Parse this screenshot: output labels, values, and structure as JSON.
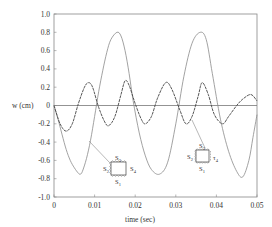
{
  "chart_data": {
    "type": "line",
    "title": "",
    "xlabel": "time (sec)",
    "ylabel": "w (cm)",
    "xlim": [
      0,
      0.05
    ],
    "ylim": [
      -1.0,
      1.0
    ],
    "x_ticks": [
      "0",
      "0.01",
      "0.02",
      "0.03",
      "0.04",
      "0.05"
    ],
    "y_ticks": [
      "1.0",
      "0.8",
      "0.6",
      "0.4",
      "0.2",
      "0",
      "-0.2",
      "-0.4",
      "-0.6",
      "-0.8",
      "-1.0"
    ],
    "grid": false,
    "zero_line": true,
    "series": [
      {
        "name": "S1, S2, S3 clamped; S4 simply supported",
        "style": "dark dashed",
        "color": "#444444",
        "x": [
          0,
          0.0015,
          0.003,
          0.0045,
          0.006,
          0.0075,
          0.0085,
          0.0095,
          0.011,
          0.0125,
          0.0135,
          0.015,
          0.0165,
          0.0175,
          0.0185,
          0.02,
          0.0215,
          0.0225,
          0.024,
          0.0255,
          0.0275,
          0.029,
          0.031,
          0.0325,
          0.034,
          0.0355,
          0.0365,
          0.038,
          0.0395,
          0.0415,
          0.043,
          0.045,
          0.0465,
          0.0485,
          0.05
        ],
        "y": [
          0,
          -0.2,
          -0.28,
          -0.2,
          0.02,
          0.2,
          0.25,
          0.2,
          -0.02,
          -0.18,
          -0.22,
          -0.12,
          0.12,
          0.27,
          0.22,
          0.02,
          -0.15,
          -0.2,
          -0.12,
          0.08,
          0.25,
          0.18,
          -0.05,
          -0.2,
          -0.12,
          0.1,
          0.25,
          0.12,
          -0.1,
          -0.2,
          -0.12,
          0.0,
          0.07,
          0.12,
          0.05
        ]
      },
      {
        "name": "S1, S3 clamped; S2 simply supported; S4 free",
        "style": "gray solid",
        "color": "#8a8a8a",
        "x": [
          0,
          0.001,
          0.002,
          0.003,
          0.004,
          0.005,
          0.006,
          0.0065,
          0.007,
          0.008,
          0.009,
          0.01,
          0.011,
          0.012,
          0.013,
          0.014,
          0.0155,
          0.0165,
          0.0175,
          0.0185,
          0.0195,
          0.021,
          0.0225,
          0.024,
          0.026,
          0.028,
          0.03,
          0.032,
          0.034,
          0.036,
          0.0375,
          0.039,
          0.041,
          0.043,
          0.045,
          0.0465,
          0.048,
          0.049,
          0.05
        ],
        "y": [
          0,
          -0.15,
          -0.32,
          -0.48,
          -0.6,
          -0.68,
          -0.74,
          -0.75,
          -0.72,
          -0.58,
          -0.38,
          -0.12,
          0.15,
          0.38,
          0.58,
          0.72,
          0.8,
          0.76,
          0.6,
          0.35,
          0.05,
          -0.3,
          -0.55,
          -0.7,
          -0.75,
          -0.62,
          -0.2,
          0.32,
          0.68,
          0.8,
          0.72,
          0.35,
          -0.15,
          -0.5,
          -0.72,
          -0.78,
          -0.6,
          -0.35,
          -0.1
        ]
      }
    ],
    "annotations": [
      {
        "type": "inset-diagram",
        "near_series": "S1, S3 clamped; S2 simply supported; S4 free",
        "labels": {
          "top": "S3",
          "left": "S2",
          "right": "S4",
          "bottom": "S1"
        },
        "position": "lower-left, x≈0.013, y≈-0.7"
      },
      {
        "type": "inset-diagram",
        "near_series": "S1, S2, S3 clamped; S4 simply supported",
        "labels": {
          "top": "S3",
          "left": "S2",
          "right": "τ4",
          "bottom": "S1"
        },
        "position": "lower-right, x≈0.035, y≈-0.6"
      }
    ]
  },
  "labels": {
    "ylabel": "w (cm)",
    "xlabel": "time (sec)",
    "inset1": {
      "top": "S",
      "top_sub": "3",
      "left": "S",
      "left_sub": "2",
      "right": "S",
      "right_sub": "4",
      "bottom": "S",
      "bottom_sub": "1"
    },
    "inset2": {
      "top": "S",
      "top_sub": "3",
      "left": "S",
      "left_sub": "2",
      "right": "τ",
      "right_sub": "4",
      "bottom": "S",
      "bottom_sub": "1"
    }
  }
}
